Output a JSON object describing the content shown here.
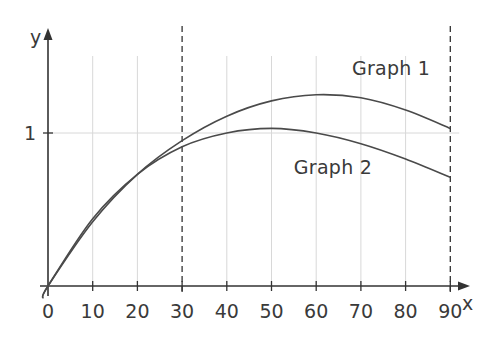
{
  "chart_data": {
    "type": "line",
    "title": "",
    "xlabel": "x",
    "ylabel": "y",
    "xlim": [
      0,
      90
    ],
    "ylim": [
      0,
      1.25
    ],
    "grid": true,
    "x_ticks": [
      0,
      10,
      20,
      30,
      40,
      50,
      60,
      70,
      80,
      90
    ],
    "x_tick_labels": [
      "0",
      "10",
      "20",
      "30",
      "40",
      "50",
      "60",
      "70",
      "80",
      "90"
    ],
    "y_ticks": [
      1
    ],
    "y_tick_labels": [
      "1"
    ],
    "dashed_vertical_lines": [
      30,
      90
    ],
    "series": [
      {
        "name": "Graph 1",
        "x": [
          0,
          10,
          20,
          30,
          40,
          50,
          60,
          70,
          80,
          90
        ],
        "values": [
          0,
          0.42,
          0.73,
          0.95,
          1.11,
          1.21,
          1.25,
          1.23,
          1.15,
          1.03
        ]
      },
      {
        "name": "Graph 2",
        "x": [
          0,
          10,
          20,
          30,
          40,
          50,
          60,
          70,
          80,
          90
        ],
        "values": [
          0,
          0.44,
          0.73,
          0.91,
          1.0,
          1.03,
          1.0,
          0.93,
          0.83,
          0.71
        ]
      }
    ],
    "annotations": [
      {
        "text": "Graph 1",
        "x": 68,
        "y": 1.38
      },
      {
        "text": "Graph 2",
        "x": 55,
        "y": 0.73
      }
    ]
  },
  "colors": {
    "axis": "#333333",
    "curve": "#4a4a4a",
    "grid": "#d8d8d8",
    "text": "#3a3a3a"
  }
}
